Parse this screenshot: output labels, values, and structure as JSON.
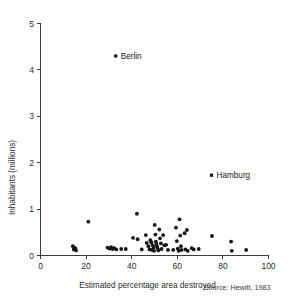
{
  "chart_data": {
    "type": "scatter",
    "title": "",
    "xlabel": "Estimated percentage area destroyed",
    "ylabel": "Inhabitants (millions)",
    "xlim": [
      0,
      100
    ],
    "ylim": [
      0,
      5
    ],
    "xticks": [
      0,
      20,
      40,
      60,
      80,
      100
    ],
    "yticks": [
      0,
      1,
      2,
      3,
      4,
      5
    ],
    "xtick_labels": [
      "0",
      "20",
      "40",
      "60",
      "80",
      "100"
    ],
    "ytick_labels": [
      "0",
      "1",
      "2",
      "3",
      "4",
      "5"
    ],
    "grid": false,
    "legend": "none",
    "source_note": "Source: Hewitt, 1983",
    "annotations": [
      {
        "label": "Berlin",
        "x": 33,
        "y": 4.3
      },
      {
        "label": "Hamburg",
        "x": 75,
        "y": 1.73
      }
    ],
    "points": [
      {
        "x": 33,
        "y": 4.3,
        "label": "Berlin"
      },
      {
        "x": 75,
        "y": 1.73,
        "label": "Hamburg"
      },
      {
        "x": 14.2,
        "y": 0.2
      },
      {
        "x": 14.6,
        "y": 0.13
      },
      {
        "x": 15.3,
        "y": 0.16
      },
      {
        "x": 15.6,
        "y": 0.11
      },
      {
        "x": 21,
        "y": 0.73
      },
      {
        "x": 29.4,
        "y": 0.17
      },
      {
        "x": 30.3,
        "y": 0.15
      },
      {
        "x": 31.0,
        "y": 0.18
      },
      {
        "x": 31.6,
        "y": 0.14
      },
      {
        "x": 32.3,
        "y": 0.16
      },
      {
        "x": 33.2,
        "y": 0.13
      },
      {
        "x": 35.4,
        "y": 0.14
      },
      {
        "x": 37.4,
        "y": 0.14
      },
      {
        "x": 40.6,
        "y": 0.38
      },
      {
        "x": 42.3,
        "y": 0.9
      },
      {
        "x": 42.6,
        "y": 0.35
      },
      {
        "x": 44.4,
        "y": 0.13
      },
      {
        "x": 46.2,
        "y": 0.44
      },
      {
        "x": 46.6,
        "y": 0.27
      },
      {
        "x": 47.3,
        "y": 0.2
      },
      {
        "x": 47.8,
        "y": 0.13
      },
      {
        "x": 48.2,
        "y": 0.33
      },
      {
        "x": 48.6,
        "y": 0.28
      },
      {
        "x": 48.9,
        "y": 0.12
      },
      {
        "x": 49.2,
        "y": 0.22
      },
      {
        "x": 49.6,
        "y": 0.17
      },
      {
        "x": 49.8,
        "y": 0.1
      },
      {
        "x": 50.1,
        "y": 0.66
      },
      {
        "x": 50.4,
        "y": 0.45
      },
      {
        "x": 50.6,
        "y": 0.3
      },
      {
        "x": 50.8,
        "y": 0.25
      },
      {
        "x": 51.1,
        "y": 0.2
      },
      {
        "x": 51.4,
        "y": 0.15
      },
      {
        "x": 51.7,
        "y": 0.11
      },
      {
        "x": 52.1,
        "y": 0.56
      },
      {
        "x": 52.4,
        "y": 0.37
      },
      {
        "x": 52.8,
        "y": 0.26
      },
      {
        "x": 53.1,
        "y": 0.14
      },
      {
        "x": 53.8,
        "y": 0.44
      },
      {
        "x": 54.3,
        "y": 0.22
      },
      {
        "x": 55.1,
        "y": 0.23
      },
      {
        "x": 55.9,
        "y": 0.12
      },
      {
        "x": 58.2,
        "y": 0.12
      },
      {
        "x": 59.4,
        "y": 0.6
      },
      {
        "x": 59.8,
        "y": 0.31
      },
      {
        "x": 60.2,
        "y": 0.15
      },
      {
        "x": 60.6,
        "y": 0.1
      },
      {
        "x": 61.0,
        "y": 0.78
      },
      {
        "x": 61.3,
        "y": 0.43
      },
      {
        "x": 61.6,
        "y": 0.2
      },
      {
        "x": 61.9,
        "y": 0.12
      },
      {
        "x": 63.2,
        "y": 0.48
      },
      {
        "x": 63.6,
        "y": 0.13
      },
      {
        "x": 64.2,
        "y": 0.55
      },
      {
        "x": 64.6,
        "y": 0.1
      },
      {
        "x": 66.3,
        "y": 0.16
      },
      {
        "x": 67.2,
        "y": 0.13
      },
      {
        "x": 69.4,
        "y": 0.14
      },
      {
        "x": 75.2,
        "y": 0.42
      },
      {
        "x": 83.6,
        "y": 0.3
      },
      {
        "x": 83.9,
        "y": 0.1
      },
      {
        "x": 90.2,
        "y": 0.12
      }
    ]
  }
}
